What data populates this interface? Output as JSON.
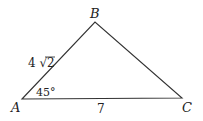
{
  "diagram": {
    "type": "triangle",
    "vertices": {
      "A": {
        "label": "A",
        "x": 22,
        "y": 99
      },
      "B": {
        "label": "B",
        "x": 95,
        "y": 22
      },
      "C": {
        "label": "C",
        "x": 182,
        "y": 98
      }
    },
    "side_labels": {
      "AB": "4 √2",
      "AC": "7"
    },
    "angle_labels": {
      "A": "45°"
    },
    "line_color": "#333333"
  }
}
